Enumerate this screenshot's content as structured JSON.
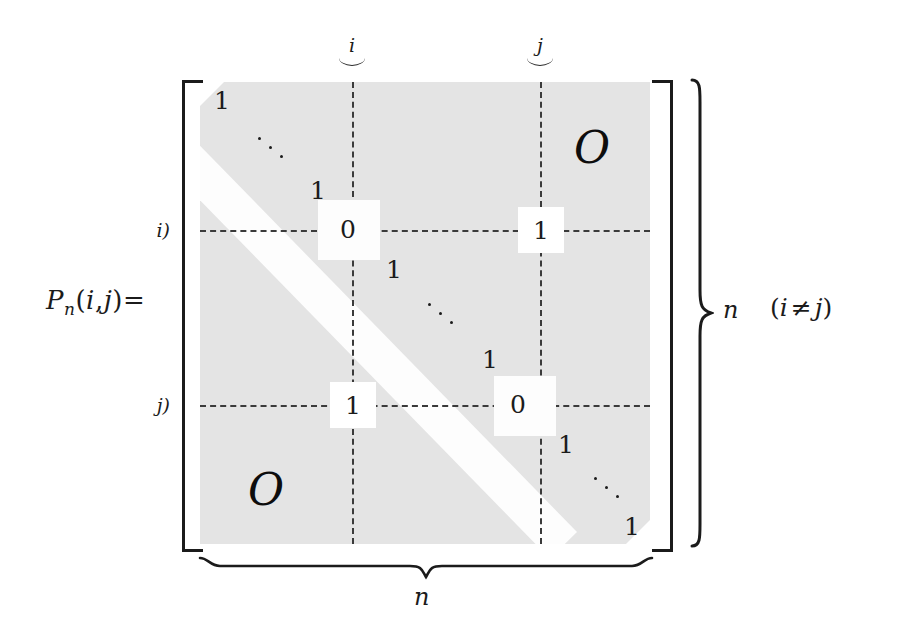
{
  "figure": {
    "kind": "matrix-definition-diagram",
    "lhs": {
      "name": "P",
      "subscript": "n",
      "args_open": "(",
      "arg1": "i",
      "comma": ",",
      "arg2": "j",
      "args_close": ")",
      "equals": "="
    },
    "row_labels": {
      "i": "i)",
      "j": "j)"
    },
    "col_labels": {
      "i": "i",
      "j": "j"
    },
    "zero_blocks": {
      "upper_right": "O",
      "lower_left": "O"
    },
    "diagonal_entries": {
      "top_left_one": "1",
      "upper_ddots": "⋱",
      "one_before_i": "1",
      "zero_at_i": "0",
      "one_after_i": "1",
      "middle_ddots": "⋱",
      "one_before_j": "1",
      "zero_at_j": "0",
      "one_after_j": "1",
      "lower_ddots": "⋱",
      "bottom_right_one": "1"
    },
    "highlighted_entries": {
      "position_i_j": "1",
      "position_j_i": "1"
    },
    "right_brace_label": "n",
    "bottom_brace_label": "n",
    "condition": {
      "open": "(",
      "left": "i",
      "relation": "≠",
      "right": "j",
      "close": ")"
    },
    "colors": {
      "shaded_block": "#e4e4e4",
      "diagonal_band": "#fdfdfd",
      "ink": "#1b1b1b",
      "dashed_guide": "#3a3a3a",
      "page": "#ffffff"
    }
  }
}
